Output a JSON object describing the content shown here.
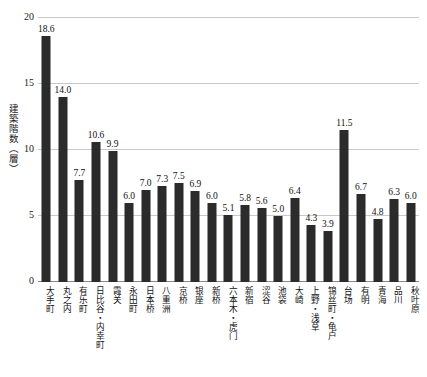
{
  "chart_data": {
    "type": "bar",
    "title": "",
    "xlabel": "",
    "ylabel": "建築階数（層）",
    "ylim": [
      0,
      20
    ],
    "yticks": [
      0,
      5,
      10,
      15,
      20
    ],
    "grid": true,
    "legend": null,
    "bar_color": "#2b2b2b",
    "grid_color": "#c9c9c9",
    "axis_color": "#8a8a8a",
    "categories": [
      "大手町",
      "丸之内",
      "有乐町",
      "日比谷・内幸町",
      "霞关",
      "永田町",
      "日本桥",
      "八重洲",
      "京桥",
      "银座",
      "新桥",
      "六本木・虎门",
      "新宿",
      "涩谷",
      "池袋",
      "大崎",
      "上野・浅草",
      "锦丝町・龟户",
      "台场",
      "有明",
      "青海",
      "品川",
      "秋叶原"
    ],
    "values": [
      18.6,
      14.0,
      7.7,
      10.6,
      9.9,
      6.0,
      7.0,
      7.3,
      7.5,
      6.9,
      6.0,
      5.1,
      5.8,
      5.6,
      5.0,
      6.4,
      4.3,
      3.9,
      11.5,
      6.7,
      4.8,
      6.3,
      6.0
    ],
    "value_labels": [
      "18.6",
      "14.0",
      "7.7",
      "10.6",
      "9.9",
      "6.0",
      "7.0",
      "7.3",
      "7.5",
      "6.9",
      "6.0",
      "5.1",
      "5.8",
      "5.6",
      "5.0",
      "6.4",
      "4.3",
      "3.9",
      "11.5",
      "6.7",
      "4.8",
      "6.3",
      "6.0"
    ],
    "ytick_labels": [
      "0",
      "5",
      "10",
      "15",
      "20"
    ]
  }
}
